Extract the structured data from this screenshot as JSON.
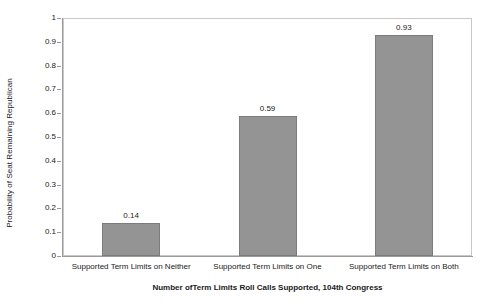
{
  "chart_data": {
    "type": "bar",
    "title": "",
    "xlabel": "Number ofTerm Limits Roll Calls Supported, 104th Congress",
    "ylabel": "Probability of Seat Remaining Republican",
    "categories": [
      "Supported Term Limits on Neither",
      "Supported Term Limits on One",
      "Supported Term Limits on Both"
    ],
    "values": [
      0.14,
      0.59,
      0.93
    ],
    "value_labels": [
      "0.14",
      "0.59",
      "0.93"
    ],
    "ylim": [
      0,
      1
    ],
    "ytick_labels": [
      "0",
      "0.1",
      "0.2",
      "0.3",
      "0.4",
      "0.5",
      "0.6",
      "0.7",
      "0.8",
      "0.9",
      "1"
    ],
    "ytick_values": [
      0,
      0.1,
      0.2,
      0.3,
      0.4,
      0.5,
      0.6,
      0.7,
      0.8,
      0.9,
      1
    ],
    "grid": false,
    "legend": false,
    "legend_position": "none",
    "bar_color": "#949494",
    "bar_border_color": "#7c7c7c",
    "axis_color": "#9a9a9a",
    "plot_border_color": "#c8c8c8",
    "text_color": "#1a1a1a"
  }
}
